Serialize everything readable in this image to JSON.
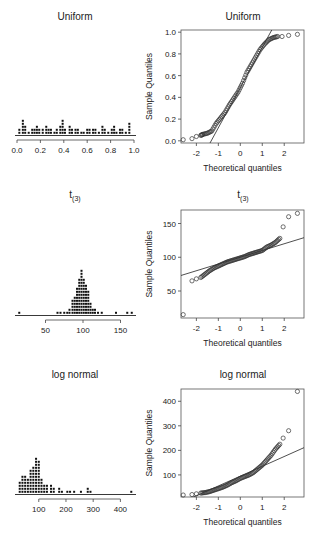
{
  "figure": {
    "rows": [
      {
        "title_left": "Uniform",
        "title_right": "Uniform"
      },
      {
        "title_left": "t",
        "title_left_sub": "(3)",
        "title_right": "t",
        "title_right_sub": "(3)"
      },
      {
        "title_left": "log normal",
        "title_right": "log normal"
      }
    ],
    "ylabel": "Sample Quantiles",
    "xlabel": "Theoretical quantiles"
  },
  "chart_data": [
    {
      "type": "scatter",
      "subtype": "dotplot",
      "title": "Uniform",
      "xlabel": "",
      "ylabel": "",
      "xticks": [
        "0.0",
        "0.2",
        "0.4",
        "0.6",
        "0.8",
        "1.0"
      ],
      "xlim": [
        0,
        1
      ],
      "bins": [
        [
          0.02,
          2
        ],
        [
          0.05,
          5
        ],
        [
          0.07,
          3
        ],
        [
          0.1,
          1
        ],
        [
          0.13,
          2
        ],
        [
          0.15,
          2
        ],
        [
          0.17,
          3
        ],
        [
          0.19,
          2
        ],
        [
          0.22,
          2
        ],
        [
          0.25,
          3
        ],
        [
          0.27,
          2
        ],
        [
          0.29,
          2
        ],
        [
          0.32,
          1
        ],
        [
          0.34,
          2
        ],
        [
          0.37,
          3
        ],
        [
          0.39,
          5
        ],
        [
          0.41,
          2
        ],
        [
          0.45,
          3
        ],
        [
          0.47,
          2
        ],
        [
          0.5,
          2
        ],
        [
          0.52,
          2
        ],
        [
          0.55,
          1
        ],
        [
          0.57,
          1
        ],
        [
          0.6,
          2
        ],
        [
          0.62,
          2
        ],
        [
          0.65,
          2
        ],
        [
          0.67,
          2
        ],
        [
          0.7,
          1
        ],
        [
          0.73,
          3
        ],
        [
          0.75,
          2
        ],
        [
          0.78,
          1
        ],
        [
          0.81,
          2
        ],
        [
          0.83,
          3
        ],
        [
          0.85,
          1
        ],
        [
          0.88,
          2
        ],
        [
          0.9,
          2
        ],
        [
          0.93,
          1
        ],
        [
          0.96,
          4
        ]
      ]
    },
    {
      "type": "scatter",
      "subtype": "qqplot",
      "title": "Uniform",
      "xlabel": "Theoretical quantiles",
      "ylabel": "Sample Quantiles",
      "xticks": [
        "-2",
        "-1",
        "0",
        "1",
        "2"
      ],
      "yticks": [
        "0.0",
        "0.2",
        "0.4",
        "0.6",
        "0.8",
        "1.0"
      ],
      "xlim": [
        -2.7,
        2.9
      ],
      "ylim": [
        -0.02,
        1.02
      ],
      "reference_line": {
        "slope": 0.37,
        "intercept": 0.49
      },
      "points_desc": "S-shaped: flat tail near 0.0 for x<-1.5, linear through middle, flat near 0.97 for x>1.5",
      "x": [
        -2.6,
        -2.2,
        -2.0,
        -1.8,
        -1.7,
        -1.5,
        -1.3,
        -1.1,
        -0.9,
        -0.7,
        -0.5,
        -0.3,
        -0.1,
        0.1,
        0.3,
        0.5,
        0.7,
        0.9,
        1.1,
        1.3,
        1.5,
        1.7,
        1.9,
        2.2,
        2.6
      ],
      "y": [
        0.01,
        0.02,
        0.04,
        0.05,
        0.06,
        0.07,
        0.09,
        0.16,
        0.21,
        0.26,
        0.33,
        0.39,
        0.45,
        0.53,
        0.63,
        0.7,
        0.77,
        0.84,
        0.89,
        0.93,
        0.95,
        0.96,
        0.96,
        0.97,
        0.98
      ]
    },
    {
      "type": "scatter",
      "subtype": "dotplot",
      "title": "t(3)",
      "xticks": [
        "50",
        "100",
        "150"
      ],
      "xlim": [
        12,
        168
      ],
      "bins": [
        [
          15,
          1
        ],
        [
          66,
          1
        ],
        [
          70,
          1
        ],
        [
          75,
          1
        ],
        [
          79,
          1
        ],
        [
          82,
          2
        ],
        [
          86,
          5
        ],
        [
          89,
          6
        ],
        [
          92,
          9
        ],
        [
          95,
          12
        ],
        [
          98,
          15
        ],
        [
          101,
          12
        ],
        [
          104,
          10
        ],
        [
          107,
          8
        ],
        [
          110,
          4
        ],
        [
          113,
          2
        ],
        [
          116,
          2
        ],
        [
          120,
          1
        ],
        [
          125,
          1
        ],
        [
          144,
          1
        ],
        [
          159,
          1
        ],
        [
          165,
          1
        ]
      ]
    },
    {
      "type": "scatter",
      "subtype": "qqplot",
      "title": "t(3)",
      "xlabel": "Theoretical quantiles",
      "ylabel": "Sample Quantiles",
      "xticks": [
        "-2",
        "-1",
        "0",
        "1",
        "2"
      ],
      "yticks": [
        "50",
        "100",
        "150"
      ],
      "xlim": [
        -2.7,
        2.9
      ],
      "ylim": [
        10,
        170
      ],
      "reference_line": {
        "slope": 10,
        "intercept": 100
      },
      "x": [
        -2.6,
        -2.2,
        -2.0,
        -1.8,
        -1.6,
        -1.4,
        -1.2,
        -1.0,
        -0.8,
        -0.6,
        -0.4,
        -0.2,
        0,
        0.2,
        0.4,
        0.6,
        0.8,
        1.0,
        1.2,
        1.4,
        1.6,
        1.8,
        1.95,
        2.2,
        2.6
      ],
      "y": [
        15,
        65,
        68,
        70,
        75,
        80,
        84,
        87,
        90,
        93,
        95,
        97,
        99,
        101,
        104,
        106,
        108,
        110,
        115,
        118,
        122,
        128,
        145,
        160,
        165
      ]
    },
    {
      "type": "scatter",
      "subtype": "dotplot",
      "title": "log normal",
      "xticks": [
        "100",
        "200",
        "300",
        "400"
      ],
      "xlim": [
        20,
        450
      ],
      "bins": [
        [
          30,
          4
        ],
        [
          40,
          6
        ],
        [
          50,
          6
        ],
        [
          60,
          5
        ],
        [
          70,
          8
        ],
        [
          80,
          9
        ],
        [
          90,
          12
        ],
        [
          100,
          11
        ],
        [
          110,
          5
        ],
        [
          120,
          3
        ],
        [
          130,
          3
        ],
        [
          145,
          3
        ],
        [
          155,
          2
        ],
        [
          175,
          2
        ],
        [
          185,
          1
        ],
        [
          205,
          1
        ],
        [
          215,
          1
        ],
        [
          230,
          1
        ],
        [
          255,
          1
        ],
        [
          280,
          2
        ],
        [
          290,
          1
        ],
        [
          440,
          1
        ]
      ]
    },
    {
      "type": "scatter",
      "subtype": "qqplot",
      "title": "log normal",
      "xlabel": "Theoretical quantiles",
      "ylabel": "Sample Quantiles",
      "xticks": [
        "-2",
        "-1",
        "0",
        "1",
        "2"
      ],
      "yticks": [
        "100",
        "200",
        "300",
        "400"
      ],
      "xlim": [
        -2.7,
        2.9
      ],
      "ylim": [
        10,
        450
      ],
      "reference_line": {
        "slope": 40,
        "intercept": 95
      },
      "x": [
        -2.6,
        -2.2,
        -2.0,
        -1.8,
        -1.6,
        -1.4,
        -1.2,
        -1.0,
        -0.8,
        -0.6,
        -0.4,
        -0.2,
        0,
        0.2,
        0.4,
        0.6,
        0.8,
        1.0,
        1.2,
        1.4,
        1.6,
        1.8,
        1.95,
        2.2,
        2.6
      ],
      "y": [
        18,
        20,
        23,
        26,
        28,
        32,
        38,
        44,
        50,
        58,
        68,
        76,
        86,
        93,
        100,
        110,
        125,
        140,
        160,
        180,
        205,
        225,
        250,
        280,
        440
      ]
    }
  ]
}
